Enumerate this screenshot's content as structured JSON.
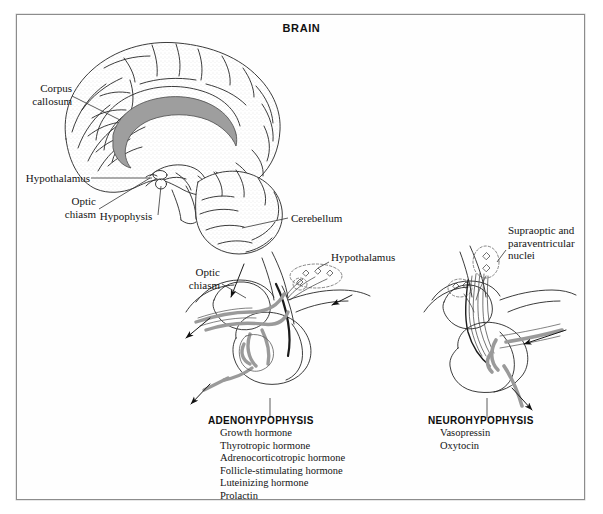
{
  "figure": {
    "title": "BRAIN",
    "frame_border_color": "#8c8c8c",
    "background_color": "#ffffff",
    "ink_color": "#1a1a1a",
    "vessel_gray": "#9a9a9a",
    "corpus_callosum_gray": "#9e9e9e"
  },
  "brain_panel": {
    "labels": {
      "corpus_callosum": "Corpus\ncallosum",
      "hypothalamus": "Hypothalamus",
      "optic_chiasm": "Optic\nchiasm",
      "hypophysis": "Hypophysis",
      "cerebellum": "Cerebellum"
    }
  },
  "left_panel": {
    "labels": {
      "optic_chiasm": "Optic\nchiasm",
      "hypothalamus": "Hypothalamus"
    },
    "section_title": "ADENOHYPOPHYSIS",
    "hormones": [
      "Growth hormone",
      "Thyrotropic hormone",
      "Adrenocorticotropic hormone",
      "Follicle-stimulating hormone",
      "Luteinizing hormone",
      "Prolactin"
    ]
  },
  "right_panel": {
    "labels": {
      "nuclei": "Supraoptic and\nparaventricular\nnuclei"
    },
    "section_title": "NEUROHYPOPHYSIS",
    "hormones": [
      "Vasopressin",
      "Oxytocin"
    ]
  }
}
